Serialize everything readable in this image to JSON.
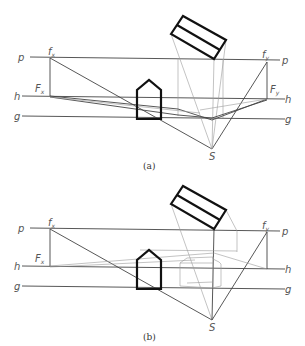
{
  "figure": {
    "panels": [
      {
        "id": "a",
        "caption": "(a)",
        "labels": {
          "p_left": "p",
          "p_right": "p",
          "h_left": "h",
          "h_right": "h",
          "g_left": "g",
          "g_right": "g",
          "fx": "f",
          "fx_sub": "x",
          "fy": "f",
          "fy_sub": "y",
          "Fx": "F",
          "Fx_sub": "x",
          "Fy": "F",
          "Fy_sub": "y",
          "S": "S"
        }
      },
      {
        "id": "b",
        "caption": "(b)",
        "labels": {
          "p_left": "p",
          "p_right": "p",
          "h_left": "h",
          "h_right": "h",
          "g_left": "g",
          "g_right": "g",
          "fx": "f",
          "fx_sub": "x",
          "fy": "f",
          "fy_sub": "y",
          "Fx": "F",
          "Fx_sub": "x",
          "S": "S"
        }
      }
    ]
  }
}
